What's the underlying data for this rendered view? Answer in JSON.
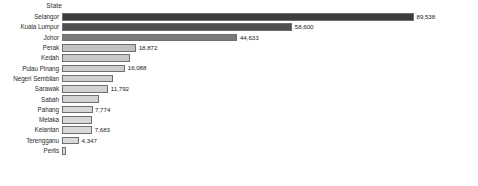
{
  "chart_data": {
    "type": "bar",
    "orientation": "horizontal",
    "title": "",
    "xlabel": "",
    "ylabel": "State",
    "category_header": "State",
    "grid": false,
    "legend": false,
    "xlim": [
      0,
      89538
    ],
    "categories": [
      "Selangor",
      "Kuala Lumpur",
      "Johor",
      "Perak",
      "Kedah",
      "Pulau Pinang",
      "Negeri Sembilan",
      "Sarawak",
      "Sabah",
      "Pahang",
      "Melaka",
      "Kelantan",
      "Terengganu",
      "Perlis"
    ],
    "values": [
      89538,
      58600,
      44633,
      18872,
      17400,
      16088,
      13100,
      11792,
      9300,
      7774,
      7700,
      7683,
      4347,
      900
    ],
    "value_labels": [
      "89,538",
      "58,600",
      "44,633",
      "18,872",
      "",
      "16,088",
      "",
      "11,792",
      "",
      "7,774",
      "",
      "7,683",
      "4,347",
      ""
    ],
    "bar_colors": [
      "#3d3d3d",
      "#4f4f4f",
      "#7a7a7a",
      "#c2c2c2",
      "#c9c9c9",
      "#cdcdcd",
      "#d0d0d0",
      "#d2d2d2",
      "#d4d4d4",
      "#d6d6d6",
      "#d7d7d7",
      "#d8d8d8",
      "#d9d9d9",
      "#dadada"
    ]
  }
}
